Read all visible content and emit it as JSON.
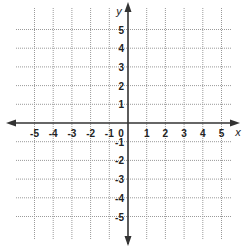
{
  "chart_data": {
    "type": "scatter",
    "title": "",
    "xlabel": "x",
    "ylabel": "y",
    "xlim": [
      -5,
      5
    ],
    "ylim": [
      -5,
      5
    ],
    "grid": true,
    "grid_style": "dotted",
    "x_ticks": [
      -5,
      -4,
      -3,
      -2,
      -1,
      1,
      2,
      3,
      4,
      5
    ],
    "y_ticks": [
      5,
      4,
      3,
      2,
      1,
      -1,
      -2,
      -3,
      -4,
      -5
    ],
    "origin_label": "0",
    "points": [],
    "axis_arrows": true,
    "legend": null
  },
  "labels": {
    "x_axis": "x",
    "y_axis": "y",
    "origin": "0"
  },
  "colors": {
    "axis": "#333333",
    "grid": "#9a9a9a",
    "background": "#ffffff",
    "text": "#222222"
  }
}
